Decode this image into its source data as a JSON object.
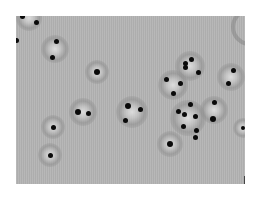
{
  "image": {
    "description": "Grayscale micrograph of particles with halos on a grey field",
    "background_color": "#b4b4b4",
    "frame_color": "#ffffff",
    "panel": {
      "x": 16,
      "y": 16,
      "w": 229,
      "h": 168
    }
  },
  "particles": [
    {
      "x": 22,
      "y": 16,
      "r": 2.5
    },
    {
      "x": 36,
      "y": 22,
      "r": 2.5
    },
    {
      "x": 16,
      "y": 40,
      "r": 2.5
    },
    {
      "x": 56,
      "y": 41,
      "r": 2.5
    },
    {
      "x": 52,
      "y": 57,
      "r": 2.5
    },
    {
      "x": 97,
      "y": 72,
      "r": 3
    },
    {
      "x": 78,
      "y": 112,
      "r": 3
    },
    {
      "x": 88,
      "y": 113,
      "r": 2.5
    },
    {
      "x": 128,
      "y": 106,
      "r": 3
    },
    {
      "x": 140,
      "y": 109,
      "r": 2.5
    },
    {
      "x": 125,
      "y": 120,
      "r": 2.5
    },
    {
      "x": 53,
      "y": 127,
      "r": 2.5
    },
    {
      "x": 50,
      "y": 155,
      "r": 2.5
    },
    {
      "x": 166,
      "y": 79,
      "r": 2.5
    },
    {
      "x": 180,
      "y": 83,
      "r": 2.5
    },
    {
      "x": 173,
      "y": 93,
      "r": 2.5
    },
    {
      "x": 191,
      "y": 59,
      "r": 2.5
    },
    {
      "x": 185,
      "y": 63,
      "r": 2.5
    },
    {
      "x": 185,
      "y": 67,
      "r": 2.5
    },
    {
      "x": 198,
      "y": 72,
      "r": 2.5
    },
    {
      "x": 233,
      "y": 70,
      "r": 2.5
    },
    {
      "x": 228,
      "y": 83,
      "r": 2.5
    },
    {
      "x": 190,
      "y": 104,
      "r": 2.5
    },
    {
      "x": 178,
      "y": 111,
      "r": 2.5
    },
    {
      "x": 184,
      "y": 114,
      "r": 2.5
    },
    {
      "x": 195,
      "y": 116,
      "r": 2.5
    },
    {
      "x": 183,
      "y": 126,
      "r": 2.5
    },
    {
      "x": 196,
      "y": 130,
      "r": 2.5
    },
    {
      "x": 195,
      "y": 137,
      "r": 2.5
    },
    {
      "x": 214,
      "y": 102,
      "r": 2.5
    },
    {
      "x": 213,
      "y": 119,
      "r": 3
    },
    {
      "x": 170,
      "y": 144,
      "r": 3
    },
    {
      "x": 243,
      "y": 128,
      "r": 2
    }
  ],
  "halos": [
    {
      "x": 29,
      "y": 18,
      "r": 13
    },
    {
      "x": 55,
      "y": 49,
      "r": 14
    },
    {
      "x": 97,
      "y": 72,
      "r": 12
    },
    {
      "x": 83,
      "y": 112,
      "r": 14
    },
    {
      "x": 132,
      "y": 112,
      "r": 16
    },
    {
      "x": 53,
      "y": 127,
      "r": 12
    },
    {
      "x": 50,
      "y": 155,
      "r": 12
    },
    {
      "x": 190,
      "y": 66,
      "r": 15
    },
    {
      "x": 173,
      "y": 85,
      "r": 15
    },
    {
      "x": 231,
      "y": 77,
      "r": 14
    },
    {
      "x": 188,
      "y": 118,
      "r": 18
    },
    {
      "x": 214,
      "y": 110,
      "r": 14
    },
    {
      "x": 170,
      "y": 144,
      "r": 13
    },
    {
      "x": 243,
      "y": 128,
      "r": 10
    }
  ]
}
